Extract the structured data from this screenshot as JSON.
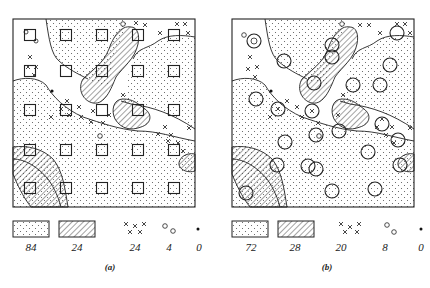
{
  "figure": {
    "panels": [
      {
        "id": "a",
        "caption": "(a)",
        "sampling_symbol": "square",
        "legend": [
          {
            "pattern": "stippled",
            "value": "84"
          },
          {
            "pattern": "hatched",
            "value": "24"
          },
          {
            "pattern": "crosses",
            "value": "24"
          },
          {
            "pattern": "open-circles",
            "value": "4"
          },
          {
            "pattern": "dot",
            "value": "0"
          }
        ]
      },
      {
        "id": "b",
        "caption": "(b)",
        "sampling_symbol": "circle",
        "legend": [
          {
            "pattern": "stippled",
            "value": "72"
          },
          {
            "pattern": "hatched",
            "value": "28"
          },
          {
            "pattern": "crosses",
            "value": "20"
          },
          {
            "pattern": "open-circles",
            "value": "8"
          },
          {
            "pattern": "dot",
            "value": "0"
          }
        ]
      }
    ]
  },
  "colors": {
    "ink": "#222222",
    "paper": "#ffffff"
  }
}
